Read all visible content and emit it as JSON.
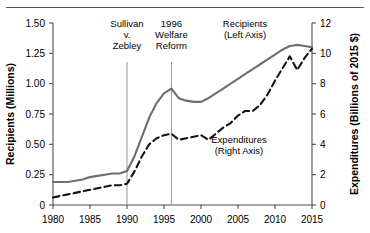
{
  "chart_data": {
    "type": "line",
    "title": "",
    "xlabel": "",
    "ylabel": "Recipients (Millions)",
    "y2label": "Expenditures (Billions of 2015 $)",
    "xlim": [
      1980,
      2015
    ],
    "ylim": [
      0,
      1.5
    ],
    "y2lim": [
      0,
      12
    ],
    "grid": false,
    "legend_position": "inline-annotations",
    "xticks": [
      "1980",
      "1985",
      "1990",
      "1995",
      "2000",
      "2005",
      "2010",
      "2015"
    ],
    "xtick_values": [
      1980,
      1985,
      1990,
      1995,
      2000,
      2005,
      2010,
      2015
    ],
    "yticks": [
      "0",
      "0.25",
      "0.50",
      "0.75",
      "1.00",
      "1.25",
      "1.50"
    ],
    "ytick_values": [
      0,
      0.25,
      0.5,
      0.75,
      1.0,
      1.25,
      1.5
    ],
    "y2ticks": [
      "0",
      "2",
      "4",
      "6",
      "8",
      "10",
      "12"
    ],
    "y2tick_values": [
      0,
      2,
      4,
      6,
      8,
      10,
      12
    ],
    "x": [
      1980,
      1981,
      1982,
      1983,
      1984,
      1985,
      1986,
      1987,
      1988,
      1989,
      1990,
      1991,
      1992,
      1993,
      1994,
      1995,
      1996,
      1997,
      1998,
      1999,
      2000,
      2001,
      2002,
      2003,
      2004,
      2005,
      2006,
      2007,
      2008,
      2009,
      2010,
      2011,
      2012,
      2013,
      2014,
      2015
    ],
    "series": [
      {
        "name": "Recipients",
        "axis": "left",
        "units": "Millions",
        "style": "solid",
        "color": "#6e6e6e",
        "label": "Recipients",
        "label_sub": "(Left Axis)",
        "values": [
          0.19,
          0.19,
          0.19,
          0.2,
          0.21,
          0.23,
          0.24,
          0.25,
          0.26,
          0.26,
          0.28,
          0.4,
          0.56,
          0.72,
          0.84,
          0.92,
          0.96,
          0.88,
          0.86,
          0.85,
          0.85,
          0.88,
          0.92,
          0.96,
          1.0,
          1.04,
          1.08,
          1.12,
          1.16,
          1.2,
          1.24,
          1.28,
          1.31,
          1.32,
          1.31,
          1.3
        ]
      },
      {
        "name": "Expenditures",
        "axis": "right",
        "units": "Billions of 2015 $",
        "style": "dashed",
        "color": "#141414",
        "label": "Expenditures",
        "label_sub": "(Right Axis)",
        "values": [
          0.5,
          0.6,
          0.7,
          0.8,
          0.9,
          1.0,
          1.1,
          1.2,
          1.3,
          1.3,
          1.4,
          2.2,
          3.2,
          4.0,
          4.4,
          4.6,
          4.7,
          4.3,
          4.4,
          4.5,
          4.6,
          4.3,
          4.7,
          5.1,
          5.4,
          5.9,
          6.2,
          6.2,
          6.6,
          7.3,
          8.2,
          9.0,
          9.8,
          8.9,
          9.7,
          10.3
        ]
      }
    ],
    "annotations": [
      {
        "id": "sullivan-v-zebley",
        "lines": [
          "Sullivan",
          "v.",
          "Zebley"
        ],
        "x": 1990
      },
      {
        "id": "welfare-reform",
        "lines": [
          "1996",
          "Welfare",
          "Reform"
        ],
        "x": 1996
      }
    ]
  }
}
